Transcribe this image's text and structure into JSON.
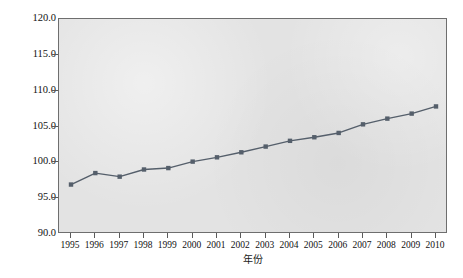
{
  "chart_data": {
    "type": "line",
    "title": "",
    "xlabel": "年份",
    "ylabel": "可持续发展能力(1995年全国为100)",
    "categories": [
      "1995",
      "1996",
      "1997",
      "1998",
      "1999",
      "2000",
      "2001",
      "2002",
      "2003",
      "2004",
      "2005",
      "2006",
      "2007",
      "2008",
      "2009",
      "2010"
    ],
    "values": [
      96.9,
      98.5,
      98.0,
      99.0,
      99.2,
      100.1,
      100.7,
      101.4,
      102.2,
      103.0,
      103.5,
      104.1,
      105.3,
      106.1,
      106.8,
      107.8
    ],
    "x": [
      1995,
      1996,
      1997,
      1998,
      1999,
      2000,
      2001,
      2002,
      2003,
      2004,
      2005,
      2006,
      2007,
      2008,
      2009,
      2010
    ],
    "ylim": [
      90.0,
      120.0
    ],
    "xlim": [
      1995,
      2010
    ],
    "ytick_labels": [
      "120.0",
      "115.0",
      "110.0",
      "105.0",
      "100.0",
      "95.0",
      "90.0"
    ],
    "ytick_values": [
      120.0,
      115.0,
      110.0,
      105.0,
      100.0,
      95.0,
      90.0
    ],
    "grid": false,
    "legend": "none",
    "series": [
      {
        "name": "可持续发展能力",
        "values": [
          96.9,
          98.5,
          98.0,
          99.0,
          99.2,
          100.1,
          100.7,
          101.4,
          102.2,
          103.0,
          103.5,
          104.1,
          105.3,
          106.1,
          106.8,
          107.8
        ]
      }
    ],
    "colors": {
      "line": "#555f6b",
      "marker": "#555f6b",
      "plot_background": "#e3e3e3",
      "frame": "#6e6e6e",
      "figure_background": "#ffffff",
      "text": "#111111"
    },
    "marker_style": "square"
  }
}
